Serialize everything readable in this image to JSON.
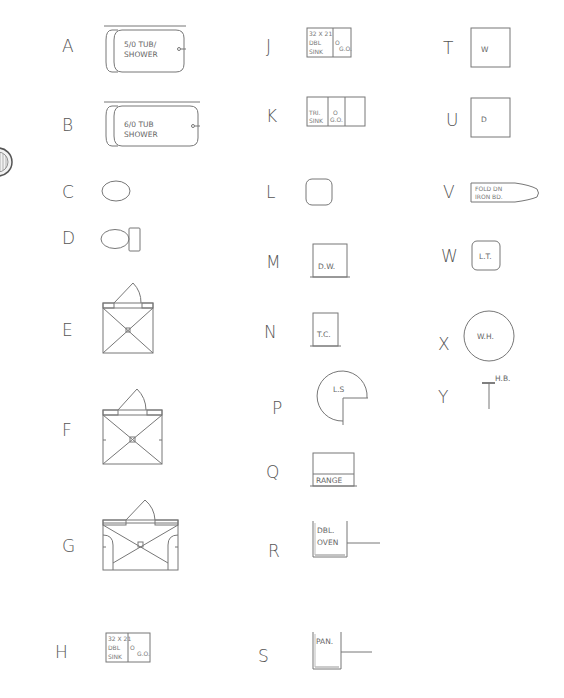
{
  "symbols": {
    "A": {
      "letter": "A",
      "label_line1": "5/0 TUB/",
      "label_line2": "SHOWER"
    },
    "B": {
      "letter": "B",
      "label_line1": "6/0 TUB",
      "label_line2": "SHOWER"
    },
    "C": {
      "letter": "C"
    },
    "D": {
      "letter": "D"
    },
    "E": {
      "letter": "E"
    },
    "F": {
      "letter": "F"
    },
    "G": {
      "letter": "G"
    },
    "H": {
      "letter": "H",
      "line1": "32 X 21",
      "line2": "DBL",
      "line3": "SINK",
      "drain": "O",
      "go": "G.O."
    },
    "J": {
      "letter": "J",
      "line1": "32 X 21",
      "line2": "DBL",
      "line3": "SINK",
      "drain": "O",
      "go": "G.O."
    },
    "K": {
      "letter": "K",
      "line1": "TRI.",
      "line2": "SINK",
      "drain": "O",
      "go": "G.O."
    },
    "L": {
      "letter": "L"
    },
    "M": {
      "letter": "M",
      "label": "D.W."
    },
    "N": {
      "letter": "N",
      "label": "T.C."
    },
    "P": {
      "letter": "P",
      "label": "L.S"
    },
    "Q": {
      "letter": "Q",
      "label": "RANGE"
    },
    "R": {
      "letter": "R",
      "line1": "DBL.",
      "line2": "OVEN"
    },
    "S": {
      "letter": "S",
      "label": "PAN."
    },
    "T": {
      "letter": "T",
      "label": "W"
    },
    "U": {
      "letter": "U",
      "label": "D"
    },
    "V": {
      "letter": "V",
      "line1": "FOLD DN",
      "line2": "IRON BD."
    },
    "W": {
      "letter": "W",
      "label": "L.T."
    },
    "X": {
      "letter": "X",
      "label": "W.H."
    },
    "Y": {
      "letter": "Y",
      "label": "H.B."
    }
  },
  "colors": {
    "line": "#777777",
    "text": "#555555",
    "background": "#ffffff"
  }
}
